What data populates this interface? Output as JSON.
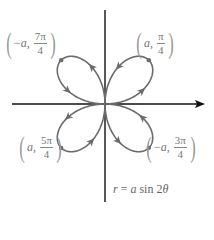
{
  "diagram": {
    "type": "polar-rose",
    "equation": "r = a sin 2θ",
    "equation_parts": {
      "lhs": "r",
      "eq": "=",
      "rhs_coef": "a",
      "rhs_fn": "sin 2",
      "rhs_var": "θ"
    },
    "origin_px": [
      105,
      104
    ],
    "a_px": 62,
    "axes": {
      "horizontal": {
        "from": [
          12,
          104
        ],
        "to": [
          205,
          104
        ],
        "arrow": "right"
      },
      "vertical": {
        "from": [
          105,
          10
        ],
        "to": [
          105,
          202
        ],
        "arrow": "none"
      }
    },
    "colors": {
      "curve": "#6b6b6b",
      "axis": "#111111",
      "label": "#777777"
    },
    "points": [
      {
        "id": "upper-right",
        "sign": "",
        "r": "a",
        "num": "π",
        "den": "4",
        "pos": [
          134,
          28
        ]
      },
      {
        "id": "upper-left",
        "sign": "−",
        "r": "a",
        "num": "7π",
        "den": "4",
        "pos": [
          4,
          28
        ]
      },
      {
        "id": "lower-left",
        "sign": "",
        "r": "a",
        "num": "5π",
        "den": "4",
        "pos": [
          17,
          132
        ]
      },
      {
        "id": "lower-right",
        "sign": "−",
        "r": "a",
        "num": "3π",
        "den": "4",
        "pos": [
          144,
          132
        ]
      }
    ]
  }
}
